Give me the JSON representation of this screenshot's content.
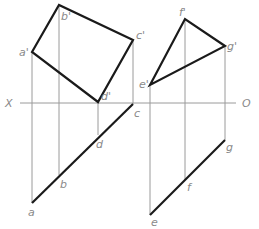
{
  "axis": {
    "left_label": "X",
    "right_label": "O",
    "y": 103,
    "x_start": 20,
    "x_end": 236
  },
  "figures": [
    {
      "name": "quadrilateral",
      "front_view": {
        "points": [
          {
            "label": "a'",
            "x": 32,
            "y": 52
          },
          {
            "label": "b'",
            "x": 59,
            "y": 5
          },
          {
            "label": "c'",
            "x": 133,
            "y": 40
          },
          {
            "label": "d'",
            "x": 98,
            "y": 102
          }
        ]
      },
      "top_view": {
        "points": [
          {
            "label": "a",
            "x": 32,
            "y": 203
          },
          {
            "label": "b",
            "x": 59,
            "y": 175
          },
          {
            "label": "d",
            "x": 98,
            "y": 135
          },
          {
            "label": "c",
            "x": 133,
            "y": 104
          }
        ]
      }
    },
    {
      "name": "triangle",
      "front_view": {
        "points": [
          {
            "label": "e'",
            "x": 150,
            "y": 85
          },
          {
            "label": "f'",
            "x": 185,
            "y": 19
          },
          {
            "label": "g'",
            "x": 225,
            "y": 46
          }
        ]
      },
      "top_view": {
        "points": [
          {
            "label": "e",
            "x": 150,
            "y": 215
          },
          {
            "label": "f",
            "x": 185,
            "y": 180
          },
          {
            "label": "g",
            "x": 225,
            "y": 140
          }
        ]
      }
    }
  ],
  "labels": {
    "a_prime": "a'",
    "b_prime": "b'",
    "c_prime": "c'",
    "d_prime": "d'",
    "a": "a",
    "b": "b",
    "c": "c",
    "d": "d",
    "e_prime": "e'",
    "f_prime": "f'",
    "g_prime": "g'",
    "e": "e",
    "f": "f",
    "g": "g",
    "x_axis": "X",
    "o_axis": "O"
  },
  "colors": {
    "thick_line": "#1a1a1a",
    "thin_line": "#9a9a9a",
    "label": "#8a8a8a"
  }
}
